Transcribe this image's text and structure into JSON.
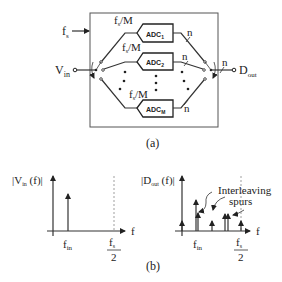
{
  "figure_a": {
    "caption": "(a)",
    "clock_label": "f",
    "clock_sub": "s",
    "input_label": "V",
    "input_sub": "in",
    "output_label": "D",
    "output_sub": "out",
    "adcs": [
      {
        "label": "ADC",
        "sub": "1",
        "rate_main": "f",
        "rate_sub": "s",
        "rate_div": "/M",
        "bits": "n"
      },
      {
        "label": "ADC",
        "sub": "2",
        "rate_main": "f",
        "rate_sub": "s",
        "rate_div": "/M",
        "bits": "n"
      },
      {
        "label": "ADC",
        "sub": "M",
        "rate_main": "f",
        "rate_sub": "s",
        "rate_div": "/M",
        "bits": "n"
      }
    ],
    "output_bits": "n"
  },
  "figure_b": {
    "caption": "(b)",
    "left_plot": {
      "ylabel_pre": "|V",
      "ylabel_sub": "in",
      "ylabel_post": " (f)|",
      "xlabel": "f",
      "tick_fin_main": "f",
      "tick_fin_sub": "in",
      "tick_fs_num_main": "f",
      "tick_fs_num_sub": "s",
      "tick_fs_den": "2"
    },
    "right_plot": {
      "ylabel_pre": "|D",
      "ylabel_sub": "out",
      "ylabel_post": " (f)|",
      "xlabel": "f",
      "tick_fin_main": "f",
      "tick_fin_sub": "in",
      "tick_fs_num_main": "f",
      "tick_fs_num_sub": "s",
      "tick_fs_den": "2",
      "annotation_line1": "Interleaving",
      "annotation_line2": "spurs"
    }
  }
}
